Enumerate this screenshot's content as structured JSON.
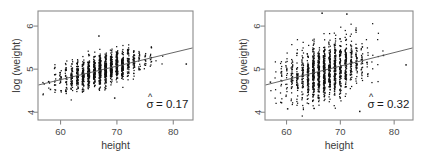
{
  "figure": {
    "background": "#ffffff",
    "frame_color": "#8a8a8a",
    "point_color": "#111111",
    "line_color": "#555555"
  },
  "chart_data": [
    {
      "type": "scatter",
      "panel": "left",
      "title": "",
      "xlabel": "height",
      "ylabel": "log (weight)",
      "xlim": [
        56.0,
        83.5
      ],
      "ylim": [
        3.82,
        6.35
      ],
      "xticks": [
        60,
        70,
        80
      ],
      "xticklabels": [
        "60",
        "70",
        "80"
      ],
      "yticks": [
        4,
        5,
        6
      ],
      "yticklabels": [
        "4",
        "5",
        "6"
      ],
      "grid": false,
      "legend": false,
      "annotation": "= 0.17",
      "annotation_symbol": "σ",
      "annotation_hat": "^",
      "annotation_full": "σ̂ = 0.17",
      "sigma_hat": 0.17,
      "fit_line": {
        "slope": 0.0315,
        "intercept": 2.865,
        "x_start": 56.0,
        "y_start": 4.63,
        "x_end": 83.5,
        "y_end": 5.495
      },
      "n_points": 1400,
      "x_center": 67.3,
      "x_sd": 3.5,
      "x_discrete_step": 1,
      "notes": "tight vertical scatter about the fitted line; residual sd 0.17",
      "outliers": [
        {
          "x": 82.3,
          "y": 5.12
        },
        {
          "x": 69.6,
          "y": 4.33
        },
        {
          "x": 66.8,
          "y": 5.77
        },
        {
          "x": 57.1,
          "y": 4.66
        },
        {
          "x": 59.0,
          "y": 5.04
        },
        {
          "x": 58.2,
          "y": 4.53
        }
      ]
    },
    {
      "type": "scatter",
      "panel": "right",
      "title": "",
      "xlabel": "height",
      "ylabel": "log (weight)",
      "xlim": [
        56.0,
        83.5
      ],
      "ylim": [
        3.82,
        6.35
      ],
      "xticks": [
        60,
        70,
        80
      ],
      "xticklabels": [
        "60",
        "70",
        "80"
      ],
      "yticks": [
        4,
        5,
        6
      ],
      "yticklabels": [
        "4",
        "5",
        "6"
      ],
      "grid": false,
      "legend": false,
      "annotation": "= 0.32",
      "annotation_symbol": "σ",
      "annotation_hat": "^",
      "annotation_full": "σ̂ = 0.32",
      "sigma_hat": 0.32,
      "fit_line": {
        "slope": 0.0315,
        "intercept": 2.865,
        "x_start": 56.0,
        "y_start": 4.63,
        "x_end": 83.5,
        "y_end": 5.495
      },
      "n_points": 1400,
      "x_center": 67.0,
      "x_sd": 3.6,
      "x_discrete_step": 1,
      "notes": "wide vertical scatter about the same fitted line; residual sd 0.32",
      "outliers": [
        {
          "x": 82.2,
          "y": 5.1
        },
        {
          "x": 73.6,
          "y": 4.02
        },
        {
          "x": 71.2,
          "y": 6.28
        },
        {
          "x": 66.6,
          "y": 6.3
        },
        {
          "x": 57.0,
          "y": 4.7
        },
        {
          "x": 60.2,
          "y": 4.08
        },
        {
          "x": 78.0,
          "y": 5.32
        }
      ]
    }
  ]
}
